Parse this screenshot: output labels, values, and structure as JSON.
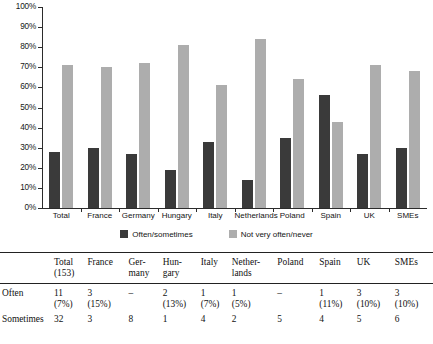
{
  "chart_data": {
    "type": "bar",
    "title": "",
    "xlabel": "",
    "ylabel": "",
    "ylim": [
      0,
      100
    ],
    "ytick_labels": [
      "0%",
      "10%",
      "20%",
      "30%",
      "40%",
      "50%",
      "60%",
      "70%",
      "80%",
      "90%",
      "100%"
    ],
    "ytick_values": [
      0,
      10,
      20,
      30,
      40,
      50,
      60,
      70,
      80,
      90,
      100
    ],
    "grid": false,
    "legend_position": "bottom",
    "categories": [
      "Total",
      "France",
      "Germany",
      "Hungary",
      "Italy",
      "Netherlands",
      "Poland",
      "Spain",
      "UK",
      "SMEs"
    ],
    "series": [
      {
        "name": "Often/sometimes",
        "color": "#3a3a3a",
        "values": [
          28,
          30,
          27,
          19,
          33,
          14,
          35,
          56,
          27,
          30
        ]
      },
      {
        "name": "Not very often/never",
        "color": "#adadad",
        "values": [
          71,
          70,
          72,
          81,
          61,
          84,
          64,
          43,
          71,
          68
        ]
      }
    ]
  },
  "legend": {
    "items": [
      {
        "label": "Often/sometimes",
        "color": "#3a3a3a"
      },
      {
        "label": "Not very often/never",
        "color": "#adadad"
      }
    ]
  },
  "table": {
    "corner": "",
    "columns": [
      {
        "line1": "Total",
        "line2": "(153)"
      },
      {
        "line1": "France",
        "line2": ""
      },
      {
        "line1": "Ger-",
        "line2": "many"
      },
      {
        "line1": "Hun-",
        "line2": "gary"
      },
      {
        "line1": "Italy",
        "line2": ""
      },
      {
        "line1": "Nether-",
        "line2": "lands"
      },
      {
        "line1": "Poland",
        "line2": ""
      },
      {
        "line1": "Spain",
        "line2": ""
      },
      {
        "line1": "UK",
        "line2": ""
      },
      {
        "line1": "SMEs",
        "line2": ""
      }
    ],
    "rows": [
      {
        "label": "Often",
        "counts": [
          "11",
          "3",
          "–",
          "2",
          "1",
          "1",
          "–",
          "1",
          "3",
          "3"
        ],
        "percents": [
          "(7%)",
          "(15%)",
          "",
          "(13%)",
          "(7%)",
          "(5%)",
          "",
          "(11%)",
          "(10%)",
          "(10%)"
        ]
      },
      {
        "label": "Sometimes",
        "counts": [
          "32",
          "3",
          "8",
          "1",
          "4",
          "2",
          "5",
          "4",
          "5",
          "6"
        ],
        "percents": [
          "",
          "",
          "",
          "",
          "",
          "",
          "",
          "",
          "",
          ""
        ]
      }
    ]
  }
}
